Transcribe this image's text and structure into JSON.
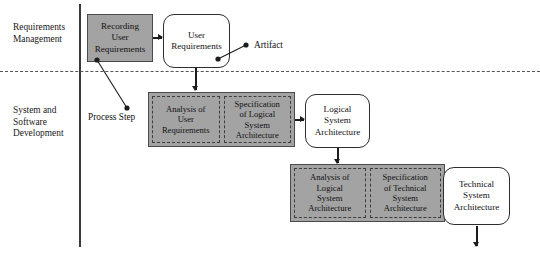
{
  "diagram": {
    "colors": {
      "process_fill": "#a3a3a3",
      "process_border": "#4a4a4a",
      "artifact_fill": "#ffffff",
      "artifact_border": "#2e2e2e",
      "arrow": "#1c1c1c",
      "axis": "#3a3a3a"
    },
    "lanes": [
      {
        "id": "requirements-management",
        "label": "Requirements\nManagement"
      },
      {
        "id": "system-software-development",
        "label": "System and\nSoftware\nDevelopment"
      }
    ],
    "callouts": [
      {
        "id": "artifact",
        "label": "Artifact"
      },
      {
        "id": "process-step",
        "label": "Process Step"
      }
    ],
    "nodes": {
      "recording_user_requirements": "Recording\nUser\nRequirements",
      "user_requirements": "User\nRequirements",
      "analysis_of_user_requirements": "Analysis of\nUser\nRequirements",
      "specification_of_logical_system_architecture": "Specification\nof Logical\nSystem\nArchitecture",
      "logical_system_architecture": "Logical\nSystem\nArchitecture",
      "analysis_of_logical_system_architecture": "Analysis of\nLogical\nSystem\nArchitecture",
      "specification_of_technical_system_architecture": "Specification\nof Technical\nSystem\nArchitecture",
      "technical_system_architecture": "Technical\nSystem\nArchitecture"
    }
  }
}
